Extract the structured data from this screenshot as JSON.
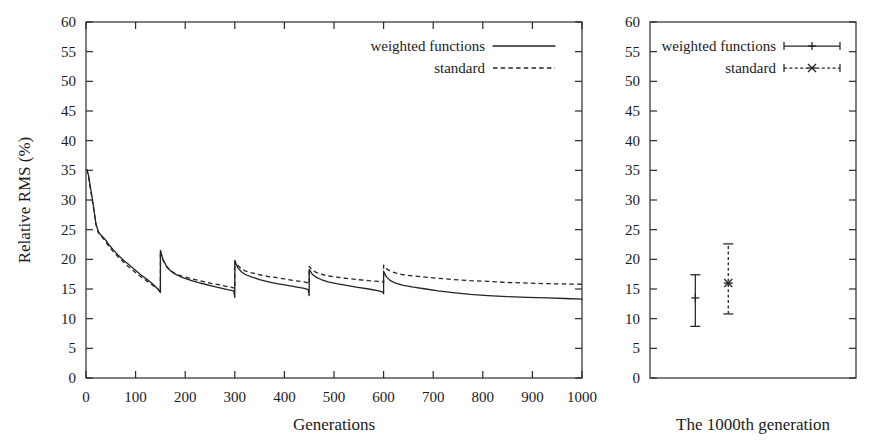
{
  "figure": {
    "background": "#ffffff",
    "ink_color": "#242424"
  },
  "chart_data": [
    {
      "type": "line",
      "panel": "left",
      "title": "",
      "xlabel": "Generations",
      "ylabel": "Relative RMS (%)",
      "xlim": [
        0,
        1000
      ],
      "ylim": [
        0,
        60
      ],
      "xticks": [
        0,
        100,
        200,
        300,
        400,
        500,
        600,
        700,
        800,
        900,
        1000
      ],
      "yticks": [
        0,
        5,
        10,
        15,
        20,
        25,
        30,
        35,
        40,
        45,
        50,
        55,
        60
      ],
      "xtick_labels": [
        "0",
        "100",
        "200",
        "300",
        "400",
        "500",
        "600",
        "700",
        "800",
        "900",
        "1000"
      ],
      "ytick_labels": [
        "0",
        "5",
        "10",
        "15",
        "20",
        "25",
        "30",
        "35",
        "40",
        "45",
        "50",
        "55",
        "60"
      ],
      "grid": false,
      "legend_position": "top-right",
      "legend": [
        "weighted functions",
        "standard"
      ],
      "restart_generations": [
        150,
        300,
        450,
        600
      ],
      "series": [
        {
          "name": "weighted functions",
          "style": "solid",
          "x": [
            2,
            5,
            8,
            12,
            16,
            20,
            25,
            30,
            38,
            46,
            55,
            65,
            75,
            85,
            95,
            105,
            115,
            125,
            135,
            145,
            150,
            150,
            155,
            162,
            170,
            180,
            195,
            210,
            225,
            240,
            255,
            270,
            285,
            298,
            300,
            300,
            306,
            313,
            322,
            335,
            350,
            368,
            385,
            400,
            420,
            440,
            448,
            450,
            450,
            456,
            464,
            474,
            488,
            505,
            525,
            545,
            570,
            590,
            598,
            600,
            600,
            606,
            614,
            624,
            640,
            660,
            685,
            710,
            740,
            775,
            810,
            850,
            890,
            930,
            965,
            1000
          ],
          "y": [
            35.0,
            34.2,
            32.6,
            30.6,
            28.4,
            26.0,
            24.6,
            24.1,
            23.4,
            22.5,
            21.6,
            20.7,
            19.9,
            19.2,
            18.5,
            17.8,
            17.1,
            16.5,
            15.8,
            15.0,
            14.4,
            21.5,
            20.0,
            18.9,
            18.1,
            17.5,
            16.9,
            16.5,
            16.1,
            15.8,
            15.5,
            15.2,
            14.9,
            14.7,
            13.6,
            19.7,
            18.6,
            17.9,
            17.4,
            17.0,
            16.6,
            16.2,
            15.9,
            15.7,
            15.4,
            15.1,
            14.9,
            13.9,
            18.3,
            17.5,
            17.0,
            16.6,
            16.2,
            15.9,
            15.6,
            15.3,
            15.0,
            14.7,
            14.5,
            14.2,
            18.0,
            17.0,
            16.4,
            16.0,
            15.6,
            15.3,
            15.0,
            14.7,
            14.4,
            14.1,
            13.9,
            13.7,
            13.6,
            13.5,
            13.4,
            13.3
          ]
        },
        {
          "name": "standard",
          "style": "dashed",
          "x": [
            2,
            5,
            8,
            12,
            16,
            20,
            25,
            30,
            38,
            46,
            55,
            65,
            75,
            85,
            95,
            105,
            115,
            125,
            135,
            145,
            150,
            150,
            155,
            162,
            170,
            180,
            195,
            210,
            225,
            240,
            255,
            270,
            285,
            298,
            300,
            300,
            306,
            313,
            322,
            335,
            350,
            368,
            385,
            400,
            420,
            440,
            448,
            450,
            450,
            456,
            464,
            474,
            488,
            505,
            525,
            545,
            570,
            590,
            598,
            600,
            600,
            606,
            614,
            624,
            640,
            660,
            685,
            710,
            740,
            775,
            810,
            850,
            890,
            930,
            965,
            1000
          ],
          "y": [
            35.2,
            34.0,
            32.3,
            30.3,
            28.2,
            25.9,
            24.5,
            24.0,
            23.2,
            22.2,
            21.3,
            20.4,
            19.6,
            18.8,
            18.1,
            17.4,
            16.8,
            16.2,
            15.6,
            15.0,
            14.5,
            21.4,
            19.9,
            18.8,
            18.1,
            17.6,
            17.1,
            16.8,
            16.5,
            16.2,
            15.9,
            15.7,
            15.4,
            15.2,
            15.0,
            19.8,
            19.0,
            18.4,
            18.0,
            17.7,
            17.4,
            17.1,
            16.9,
            16.7,
            16.4,
            16.2,
            16.0,
            15.8,
            18.8,
            18.2,
            17.8,
            17.5,
            17.2,
            17.0,
            16.8,
            16.6,
            16.4,
            16.3,
            16.2,
            16.1,
            19.0,
            18.4,
            18.0,
            17.7,
            17.4,
            17.2,
            17.0,
            16.8,
            16.6,
            16.4,
            16.3,
            16.1,
            16.0,
            15.9,
            15.85,
            15.8
          ]
        }
      ]
    },
    {
      "type": "scatter",
      "panel": "right",
      "title": "",
      "xlabel": "The 1000th generation",
      "ylabel": "",
      "ylim": [
        0,
        60
      ],
      "yticks": [
        0,
        5,
        10,
        15,
        20,
        25,
        30,
        35,
        40,
        45,
        50,
        55,
        60
      ],
      "ytick_labels": [
        "0",
        "5",
        "10",
        "15",
        "20",
        "25",
        "30",
        "35",
        "40",
        "45",
        "50",
        "55",
        "60"
      ],
      "xticks": [],
      "xtick_labels": [],
      "grid": false,
      "legend_position": "top-right",
      "legend": [
        "weighted functions",
        "standard"
      ],
      "points": [
        {
          "name": "weighted functions",
          "style": "solid",
          "x_frac": 0.22,
          "value": 13.5,
          "error_low": 8.7,
          "error_high": 17.4,
          "marker": "plus"
        },
        {
          "name": "standard",
          "style": "dashed",
          "x_frac": 0.38,
          "value": 16.0,
          "error_low": 10.8,
          "error_high": 22.6,
          "marker": "cross"
        }
      ]
    }
  ]
}
